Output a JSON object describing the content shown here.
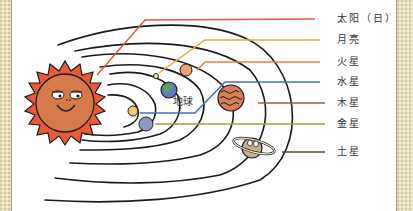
{
  "diagram": {
    "title": "",
    "labels": [
      {
        "id": "sun",
        "text": "太阳（日）",
        "color": "#e8553e",
        "y": 19
      },
      {
        "id": "moon",
        "text": "月亮",
        "color": "#f4a23b",
        "y": 40
      },
      {
        "id": "mars",
        "text": "火星",
        "color": "#ef7d3e",
        "y": 61
      },
      {
        "id": "mercury",
        "text": "水星",
        "color": "#4470b0",
        "y": 81
      },
      {
        "id": "jupiter",
        "text": "木星",
        "color": "#8a6a3a",
        "y": 103
      },
      {
        "id": "venus",
        "text": "金星",
        "color": "#a6a03c",
        "y": 124
      },
      {
        "id": "saturn",
        "text": "土星",
        "color": "#5a4630",
        "y": 152
      }
    ],
    "earth_label": "地球",
    "colors": {
      "sun_rays": "#ec5a35",
      "sun_body": "#d67a4c",
      "mercury": "#f4c870",
      "venus": "#8f9ac4",
      "earth_land": "#5fa257",
      "earth_sea": "#5a7ec0",
      "moon": "#f6e6b0",
      "mars": "#f3a173",
      "jupiter": "#d97e5b",
      "saturn": "#c9b08a",
      "border": "#e8dfbf"
    }
  }
}
